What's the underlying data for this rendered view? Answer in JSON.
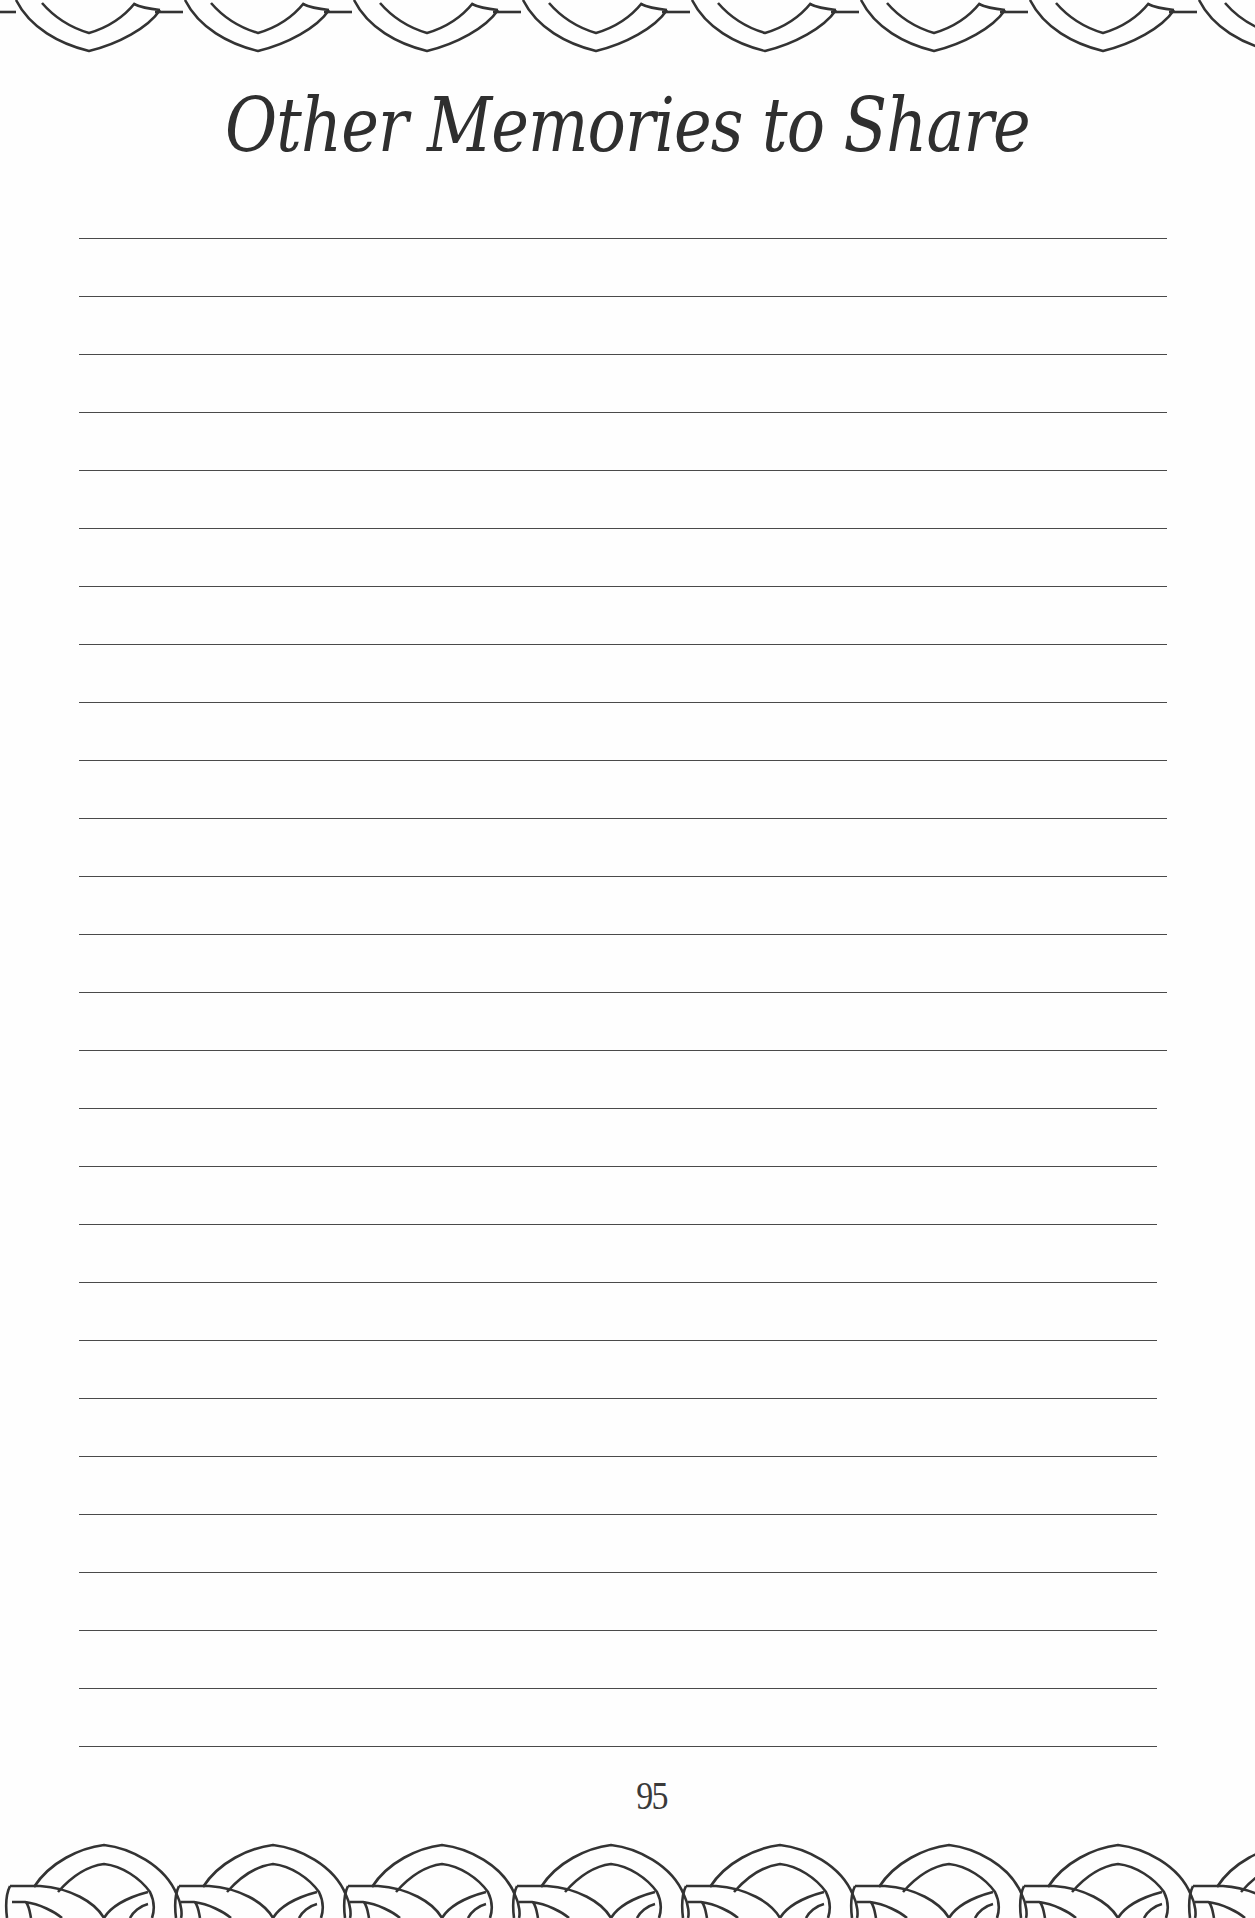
{
  "page": {
    "title": "Other Memories to Share",
    "page_number": "95",
    "ink_color": "#2f2f2f",
    "paper_color": "#fefefe"
  },
  "writing_area": {
    "line_count": 27,
    "first_line_y": 238,
    "line_spacing": 58,
    "line_left_x": 79,
    "line_right_x_upper": 1167,
    "line_right_x_lower": 1157,
    "upper_line_count": 15
  },
  "decorations": {
    "top_border_icon": "interlocking-arches-border-icon",
    "bottom_border_icon": "interlocking-rings-border-icon"
  }
}
